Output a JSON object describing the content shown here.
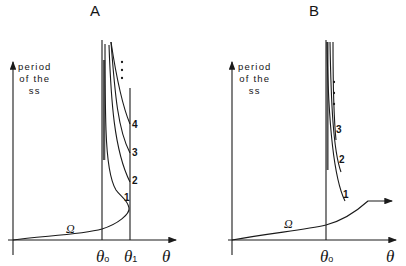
{
  "panels": [
    {
      "title": "A",
      "y_axis_label": [
        "period",
        "of the",
        "ss"
      ],
      "curve_labels": [
        "1",
        "2",
        "3",
        "4"
      ],
      "omega_label": "Ω",
      "x_ticks": [
        {
          "symbol": "θ",
          "sub": "o"
        },
        {
          "symbol": "θ",
          "sub": "1"
        }
      ],
      "x_axis_label": "θ"
    },
    {
      "title": "B",
      "y_axis_label": [
        "period",
        "of the",
        "ss"
      ],
      "curve_labels": [
        "1",
        "2",
        "3"
      ],
      "omega_label": "Ω",
      "x_ticks": [
        {
          "symbol": "θ",
          "sub": "o"
        }
      ],
      "x_axis_label": "θ"
    }
  ],
  "colors": {
    "ink": "#1a1a1a",
    "background": "#ffffff"
  }
}
